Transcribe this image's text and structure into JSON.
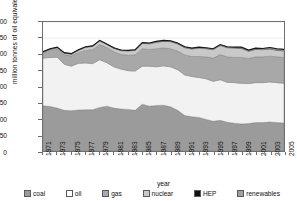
{
  "chart_data": {
    "type": "area",
    "stacked": true,
    "title": "",
    "xlabel": "year",
    "ylabel": "million tonnes of oil equivalent (mtoe)",
    "ylim": [
      0,
      400
    ],
    "yticks": [
      0,
      50,
      100,
      150,
      200,
      250,
      300,
      350,
      400
    ],
    "grid": "horizontal-faint",
    "legend_position": "bottom",
    "x": [
      1971,
      1972,
      1973,
      1974,
      1975,
      1976,
      1977,
      1978,
      1979,
      1980,
      1981,
      1982,
      1983,
      1984,
      1985,
      1986,
      1987,
      1988,
      1989,
      1990,
      1991,
      1992,
      1993,
      1994,
      1995,
      1996,
      1997,
      1998,
      1999,
      2000,
      2001,
      2002,
      2003,
      2004,
      2005
    ],
    "xticks": [
      1971,
      1973,
      1975,
      1977,
      1979,
      1981,
      1983,
      1985,
      1987,
      1989,
      1991,
      1993,
      1995,
      1997,
      1999,
      2001,
      2003,
      2005
    ],
    "series": [
      {
        "name": "coal",
        "color": "#9b9b9b",
        "values": [
          140,
          138,
          133,
          126,
          125,
          127,
          128,
          128,
          135,
          139,
          133,
          130,
          129,
          126,
          145,
          139,
          141,
          142,
          137,
          126,
          110,
          106,
          104,
          98,
          92,
          95,
          89,
          86,
          84,
          85,
          88,
          88,
          90,
          88,
          87
        ]
      },
      {
        "name": "oil",
        "color": "#f2f2f2",
        "values": [
          148,
          152,
          158,
          143,
          138,
          145,
          145,
          143,
          148,
          135,
          128,
          124,
          120,
          122,
          118,
          124,
          120,
          122,
          124,
          126,
          126,
          125,
          124,
          126,
          124,
          126,
          124,
          126,
          126,
          124,
          124,
          124,
          124,
          124,
          123
        ]
      },
      {
        "name": "gas",
        "color": "#a8a8a8",
        "values": [
          16,
          22,
          26,
          30,
          32,
          33,
          39,
          43,
          47,
          47,
          47,
          45,
          48,
          50,
          54,
          52,
          56,
          56,
          56,
          58,
          62,
          62,
          65,
          68,
          72,
          78,
          79,
          78,
          80,
          78,
          80,
          80,
          80,
          80,
          80
        ]
      },
      {
        "name": "nuclear",
        "color": "#c9c9c9",
        "values": [
          2,
          3,
          3,
          4,
          5,
          7,
          9,
          10,
          11,
          9,
          10,
          12,
          13,
          14,
          17,
          17,
          20,
          20,
          22,
          22,
          22,
          23,
          26,
          25,
          26,
          28,
          28,
          29,
          28,
          22,
          23,
          22,
          22,
          20,
          20
        ]
      },
      {
        "name": "HEP",
        "color": "#111111",
        "values": [
          1,
          1,
          1,
          1,
          1,
          1,
          1,
          1,
          1,
          1,
          1,
          1,
          1,
          1,
          1,
          1,
          1,
          1,
          1,
          1,
          1,
          1,
          1,
          1,
          1,
          1,
          1,
          1,
          1,
          1,
          1,
          1,
          1,
          1,
          1
        ]
      },
      {
        "name": "renewables",
        "color": "#9b9b9b",
        "values": [
          1,
          1,
          1,
          1,
          1,
          1,
          1,
          1,
          1,
          1,
          1,
          1,
          1,
          1,
          1,
          2,
          2,
          2,
          2,
          2,
          2,
          2,
          2,
          2,
          2,
          2,
          2,
          2,
          3,
          3,
          3,
          3,
          4,
          4,
          4
        ]
      }
    ]
  },
  "axes": {
    "y_title": "million tonnes of oil equivalent (mtoe)",
    "x_title": "year"
  },
  "legend": {
    "items": [
      {
        "label": "coal",
        "color": "#9b9b9b"
      },
      {
        "label": "oil",
        "color": "#ffffff"
      },
      {
        "label": "gas",
        "color": "#a8a8a8"
      },
      {
        "label": "nuclear",
        "color": "#c9c9c9"
      },
      {
        "label": "HEP",
        "color": "#111111"
      },
      {
        "label": "renewables",
        "color": "#a0a0a0"
      }
    ]
  },
  "colors": {
    "frame": "#6f6f6f",
    "background": "#ffffff",
    "text": "#111111"
  }
}
